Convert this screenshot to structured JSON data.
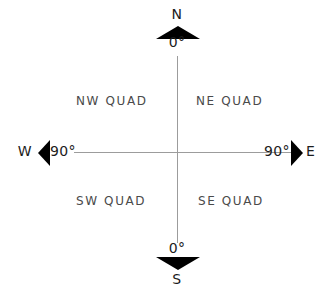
{
  "diagram": {
    "cardinals": {
      "north": "N",
      "south": "S",
      "west": "W",
      "east": "E"
    },
    "bearings": {
      "north": "0°",
      "south": "0°",
      "west": "90°",
      "east": "90°"
    },
    "quadrants": {
      "nw": "NW QUAD",
      "ne": "NE QUAD",
      "sw": "SW QUAD",
      "se": "SE QUAD"
    },
    "colors": {
      "arrowhead": "#000000",
      "axis_line": "#9c9c9c",
      "cardinal_text": "#1c1c1c",
      "quadrant_text": "#4a4a4a",
      "background": "#ffffff"
    }
  }
}
